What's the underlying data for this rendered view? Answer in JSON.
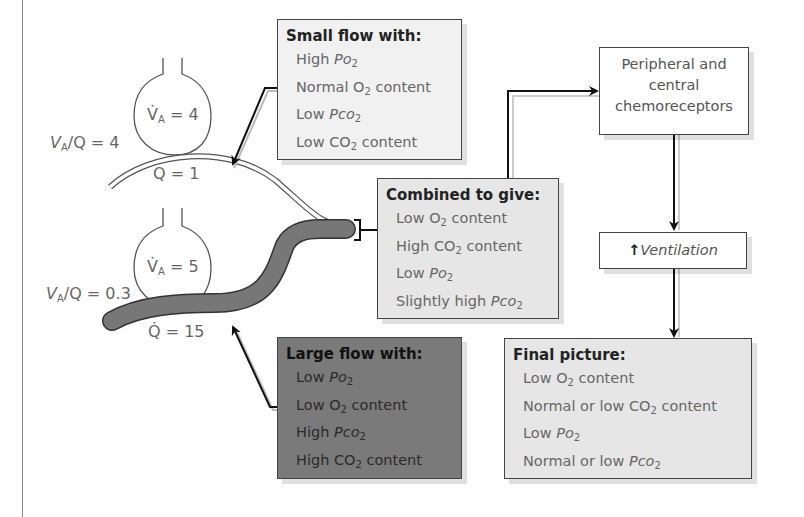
{
  "unit_top": {
    "ventilation_label": "V̇A = 4",
    "ratio_label": "VA/Q = 4",
    "flow_label": "Q = 1"
  },
  "unit_bottom": {
    "ventilation_label": "V̇A = 5",
    "ratio_label": "VA/Q = 0.3",
    "flow_label": "Q̇ = 15"
  },
  "small_flow_box": {
    "title": "Small flow with:",
    "lines": [
      "High Po2",
      "Normal O2 content",
      "Low Pco2",
      "Low CO2 content"
    ]
  },
  "large_flow_box": {
    "title": "Large flow with:",
    "lines": [
      "Low Po2",
      "Low O2 content",
      "High Pco2",
      "High CO2 content"
    ]
  },
  "combined_box": {
    "title": "Combined to give:",
    "lines": [
      "Low O2 content",
      "High CO2 content",
      "Low Po2",
      "Slightly high Pco2"
    ]
  },
  "chemoreceptors_box": {
    "lines": [
      "Peripheral and",
      "central",
      "chemoreceptors"
    ]
  },
  "ventilation_box": {
    "arrow": "↑",
    "label": "Ventilation"
  },
  "final_box": {
    "title": "Final picture:",
    "lines": [
      "Low O2 content",
      "Normal or low CO2 content",
      "Low Po2",
      "Normal or low Pco2"
    ]
  },
  "colors": {
    "small_flow_fill": "#f1f1f1",
    "combined_fill": "#e6e6e6",
    "large_flow_fill": "#7a7a7a",
    "final_fill": "#e6e6e6",
    "vessel_dark": "#777777",
    "outline": "#444444"
  }
}
